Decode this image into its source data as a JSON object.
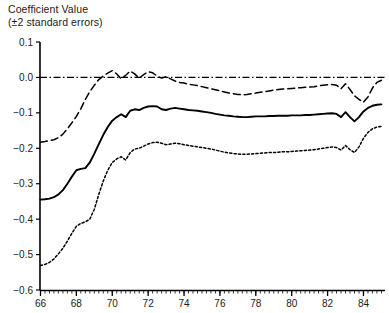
{
  "chart_data": {
    "type": "line",
    "title_line1": "Coefficient Value",
    "title_line2": "(±2 standard errors)",
    "xlabel": "",
    "ylabel": "",
    "xlim": [
      65.75,
      85.2
    ],
    "ylim": [
      -0.6,
      0.1
    ],
    "grid": false,
    "legend": false,
    "y_ticks": [
      0.1,
      0.0,
      -0.1,
      -0.2,
      -0.3,
      -0.4,
      -0.5,
      -0.6
    ],
    "y_tick_labels": [
      "0.1",
      "0.0",
      "−0.1",
      "−0.2",
      "−0.3",
      "−0.4",
      "−0.5",
      "−0.6"
    ],
    "x_ticks": [
      66,
      68,
      70,
      72,
      74,
      76,
      78,
      80,
      82,
      84
    ],
    "x_tick_labels": [
      "66",
      "68",
      "70",
      "72",
      "74",
      "76",
      "78",
      "80",
      "82",
      "84"
    ],
    "x_minor_tick_step": 0.25,
    "reference_line": {
      "y": 0.0,
      "style": "dash-dot",
      "color": "#000000"
    },
    "line_color": "#000000",
    "x": [
      66.0,
      66.25,
      66.5,
      66.75,
      67.0,
      67.25,
      67.5,
      67.75,
      68.0,
      68.25,
      68.5,
      68.75,
      69.0,
      69.25,
      69.5,
      69.75,
      70.0,
      70.25,
      70.5,
      70.75,
      71.0,
      71.25,
      71.5,
      71.75,
      72.0,
      72.25,
      72.5,
      72.75,
      73.0,
      73.25,
      73.5,
      73.75,
      74.0,
      74.25,
      74.5,
      74.75,
      75.0,
      75.25,
      75.5,
      75.75,
      76.0,
      76.25,
      76.5,
      76.75,
      77.0,
      77.25,
      77.5,
      77.75,
      78.0,
      78.25,
      78.5,
      78.75,
      79.0,
      79.25,
      79.5,
      79.75,
      80.0,
      80.25,
      80.5,
      80.75,
      81.0,
      81.25,
      81.5,
      81.75,
      82.0,
      82.25,
      82.5,
      82.75,
      83.0,
      83.25,
      83.5,
      83.75,
      84.0,
      84.25,
      84.5,
      84.75,
      85.0
    ],
    "series": [
      {
        "name": "Upper bound (+2 standard errors)",
        "style": "dashed",
        "values": [
          -0.183,
          -0.181,
          -0.178,
          -0.176,
          -0.17,
          -0.16,
          -0.145,
          -0.128,
          -0.11,
          -0.088,
          -0.062,
          -0.04,
          -0.022,
          -0.006,
          0.004,
          0.012,
          0.019,
          0.01,
          -0.004,
          0.006,
          0.018,
          0.01,
          -0.002,
          0.008,
          0.016,
          0.013,
          0.004,
          -0.002,
          0.002,
          -0.004,
          -0.01,
          -0.014,
          -0.016,
          -0.019,
          -0.021,
          -0.023,
          -0.026,
          -0.029,
          -0.032,
          -0.035,
          -0.038,
          -0.041,
          -0.044,
          -0.046,
          -0.048,
          -0.049,
          -0.048,
          -0.046,
          -0.044,
          -0.042,
          -0.04,
          -0.038,
          -0.036,
          -0.034,
          -0.033,
          -0.032,
          -0.031,
          -0.03,
          -0.029,
          -0.028,
          -0.027,
          -0.026,
          -0.024,
          -0.022,
          -0.021,
          -0.02,
          -0.022,
          -0.032,
          -0.018,
          -0.034,
          -0.052,
          -0.062,
          -0.07,
          -0.055,
          -0.03,
          -0.014,
          -0.008
        ]
      },
      {
        "name": "Coefficient estimate",
        "style": "solid",
        "values": [
          -0.345,
          -0.344,
          -0.342,
          -0.338,
          -0.33,
          -0.318,
          -0.3,
          -0.28,
          -0.262,
          -0.258,
          -0.256,
          -0.24,
          -0.215,
          -0.188,
          -0.162,
          -0.14,
          -0.122,
          -0.112,
          -0.104,
          -0.112,
          -0.094,
          -0.09,
          -0.092,
          -0.086,
          -0.082,
          -0.081,
          -0.082,
          -0.09,
          -0.092,
          -0.088,
          -0.086,
          -0.088,
          -0.09,
          -0.092,
          -0.093,
          -0.094,
          -0.096,
          -0.098,
          -0.1,
          -0.103,
          -0.105,
          -0.107,
          -0.108,
          -0.11,
          -0.111,
          -0.112,
          -0.112,
          -0.111,
          -0.11,
          -0.11,
          -0.11,
          -0.109,
          -0.109,
          -0.108,
          -0.108,
          -0.108,
          -0.107,
          -0.107,
          -0.107,
          -0.106,
          -0.106,
          -0.105,
          -0.104,
          -0.103,
          -0.102,
          -0.101,
          -0.103,
          -0.112,
          -0.098,
          -0.112,
          -0.124,
          -0.112,
          -0.096,
          -0.086,
          -0.08,
          -0.077,
          -0.076
        ]
      },
      {
        "name": "Lower bound (−2 standard errors)",
        "style": "dotted",
        "values": [
          -0.531,
          -0.528,
          -0.522,
          -0.512,
          -0.498,
          -0.482,
          -0.462,
          -0.44,
          -0.42,
          -0.412,
          -0.408,
          -0.4,
          -0.372,
          -0.33,
          -0.292,
          -0.262,
          -0.24,
          -0.23,
          -0.224,
          -0.233,
          -0.212,
          -0.202,
          -0.2,
          -0.194,
          -0.188,
          -0.184,
          -0.183,
          -0.186,
          -0.19,
          -0.188,
          -0.186,
          -0.187,
          -0.19,
          -0.192,
          -0.194,
          -0.196,
          -0.198,
          -0.2,
          -0.202,
          -0.205,
          -0.208,
          -0.211,
          -0.213,
          -0.215,
          -0.216,
          -0.217,
          -0.217,
          -0.216,
          -0.215,
          -0.214,
          -0.213,
          -0.212,
          -0.212,
          -0.211,
          -0.21,
          -0.21,
          -0.209,
          -0.208,
          -0.207,
          -0.206,
          -0.205,
          -0.204,
          -0.202,
          -0.2,
          -0.198,
          -0.196,
          -0.198,
          -0.205,
          -0.192,
          -0.204,
          -0.212,
          -0.196,
          -0.172,
          -0.155,
          -0.145,
          -0.14,
          -0.138
        ]
      }
    ]
  }
}
